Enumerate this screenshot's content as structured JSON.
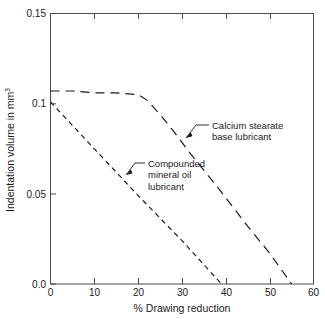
{
  "chart_data": {
    "type": "line",
    "title": "",
    "xlabel": "% Drawing reduction",
    "ylabel": "Indentation volume in mm³",
    "xlim": [
      0,
      60
    ],
    "ylim": [
      0.0,
      0.15
    ],
    "xticks": [
      "0",
      "10",
      "20",
      "30",
      "40",
      "50",
      "60"
    ],
    "xtick_values": [
      0,
      10,
      20,
      30,
      40,
      50,
      60
    ],
    "yticks": [
      "0.0",
      "0.05",
      "0.1",
      "0.15"
    ],
    "ytick_values": [
      0.0,
      0.05,
      0.1,
      0.15
    ],
    "grid": false,
    "legend_position": "inline-annotations",
    "series": [
      {
        "name": "Calcium stearate base lubricant",
        "style": "long-dashed",
        "color": "#1a1a1a",
        "x": [
          0,
          5,
          10,
          15,
          20,
          22,
          25,
          28,
          32,
          38,
          45,
          50,
          55
        ],
        "values": [
          0.107,
          0.107,
          0.106,
          0.106,
          0.105,
          0.102,
          0.094,
          0.085,
          0.072,
          0.054,
          0.032,
          0.017,
          0.0
        ]
      },
      {
        "name": "Compounded mineral oil lubricant",
        "style": "short-dashed",
        "color": "#1a1a1a",
        "x": [
          0,
          10,
          20,
          30,
          39
        ],
        "values": [
          0.101,
          0.075,
          0.049,
          0.024,
          0.0
        ]
      }
    ],
    "annotations": [
      {
        "id": "calcium-stearate",
        "lines": [
          "Calcium stearate",
          "base lubricant"
        ],
        "points_to_series": "Calcium stearate base lubricant",
        "point_x": 30.5,
        "point_y": 0.078
      },
      {
        "id": "compounded-mineral-oil",
        "lines": [
          "Compounded",
          "mineral oil",
          "lubricant"
        ],
        "points_to_series": "Compounded mineral oil lubricant",
        "point_x": 16.5,
        "point_y": 0.059
      }
    ]
  },
  "axes": {
    "x_title": "% Drawing reduction",
    "y_title_text": "Indentation volume in mm",
    "y_title_sup": "3",
    "x_tick_labels": [
      "0",
      "10",
      "20",
      "30",
      "40",
      "50",
      "60"
    ],
    "y_tick_labels": [
      "0.15",
      "0.1",
      "0.05",
      "0.0"
    ]
  },
  "annotations": {
    "calcium": {
      "line1": "Calcium stearate",
      "line2": "base lubricant"
    },
    "mineral": {
      "line1": "Compounded",
      "line2": "mineral oil",
      "line3": "lubricant"
    }
  },
  "colors": {
    "background": "#ffffff",
    "axis": "#4a4a4a",
    "curve": "#1a1a1a",
    "text": "#1a1a1a"
  }
}
